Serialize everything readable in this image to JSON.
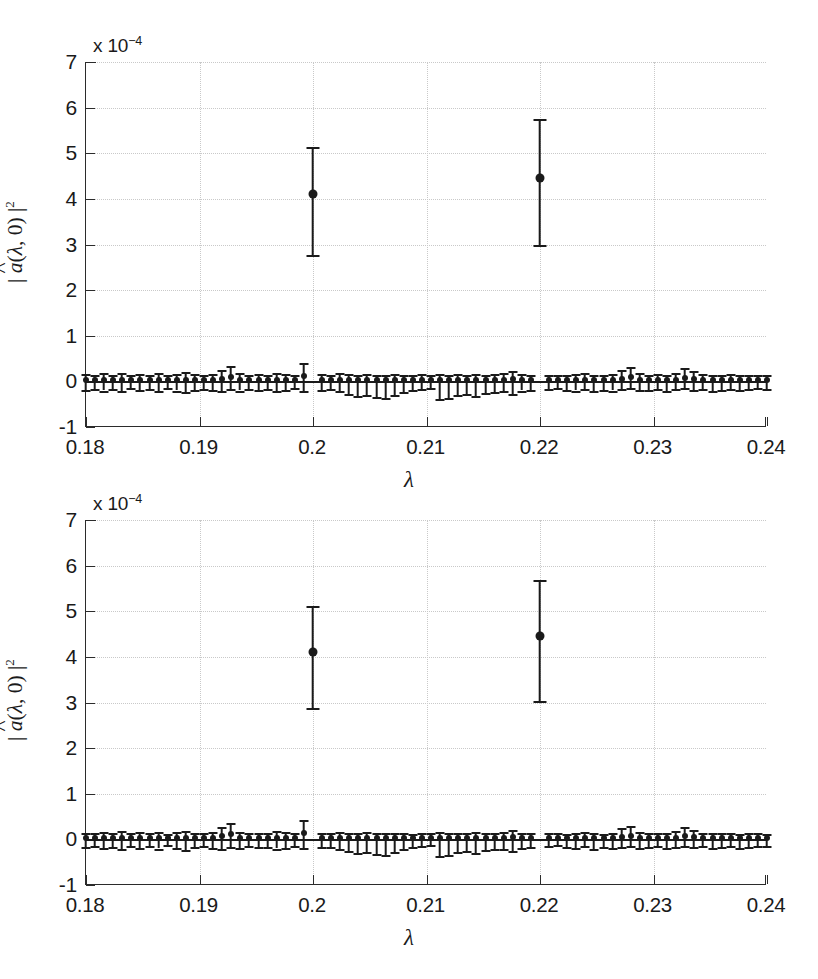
{
  "figure": {
    "panel_count": 2,
    "background": "#ffffff",
    "foreground": "#1a1a1a",
    "grid_color": "#c9c9c9"
  },
  "chart_data": [
    {
      "type": "scatter",
      "panel_index": 0,
      "title": "",
      "xlabel": "λ",
      "ylabel": "| â(λ, 0) |²",
      "y_exponent_label": "x 10",
      "y_exponent_power": "−4",
      "y_scale": 0.0001,
      "xlim": [
        0.18,
        0.24
      ],
      "ylim": [
        -1,
        7
      ],
      "xticks": [
        0.18,
        0.19,
        0.2,
        0.21,
        0.22,
        0.23,
        0.24
      ],
      "xticklabels": [
        "0.18",
        "0.19",
        "0.2",
        "0.21",
        "0.22",
        "0.23",
        "0.24"
      ],
      "yticks": [
        -1,
        0,
        1,
        2,
        3,
        4,
        5,
        6,
        7
      ],
      "yticklabels": [
        "-1",
        "0",
        "1",
        "2",
        "3",
        "4",
        "5",
        "6",
        "7"
      ],
      "grid": true,
      "legend": "none",
      "marker": "filled-circle",
      "errorbar_style": "capped-vertical",
      "series": [
        {
          "name": "peaks",
          "x": [
            0.2,
            0.22
          ],
          "y": [
            4.1,
            4.45
          ],
          "y_lower": [
            2.78,
            3.0
          ],
          "y_upper": [
            5.13,
            5.75
          ]
        },
        {
          "name": "noise-floor",
          "x": [
            0.18,
            0.1808,
            0.1816,
            0.1824,
            0.1832,
            0.184,
            0.1848,
            0.1856,
            0.1864,
            0.1872,
            0.188,
            0.1888,
            0.1896,
            0.1904,
            0.1912,
            0.192,
            0.1928,
            0.1936,
            0.1944,
            0.1952,
            0.196,
            0.1968,
            0.1976,
            0.1984,
            0.1992,
            0.2008,
            0.2016,
            0.2024,
            0.2032,
            0.204,
            0.2048,
            0.2056,
            0.2064,
            0.2072,
            0.208,
            0.2088,
            0.2096,
            0.2104,
            0.2112,
            0.212,
            0.2128,
            0.2136,
            0.2144,
            0.2152,
            0.216,
            0.2168,
            0.2176,
            0.2184,
            0.2192,
            0.2208,
            0.2216,
            0.2224,
            0.2232,
            0.224,
            0.2248,
            0.2256,
            0.2264,
            0.2272,
            0.228,
            0.2288,
            0.2296,
            0.2304,
            0.2312,
            0.232,
            0.2328,
            0.2336,
            0.2344,
            0.2352,
            0.236,
            0.2368,
            0.2376,
            0.2384,
            0.2392,
            0.24
          ],
          "y": [
            0.02,
            0.02,
            0.03,
            0.02,
            0.03,
            0.02,
            0.03,
            0.02,
            0.03,
            0.02,
            0.03,
            0.04,
            0.03,
            0.02,
            0.03,
            0.06,
            0.1,
            0.04,
            0.03,
            0.03,
            0.03,
            0.04,
            0.03,
            0.02,
            0.12,
            0.03,
            0.03,
            0.02,
            0.03,
            0.02,
            0.03,
            0.02,
            0.02,
            0.03,
            0.02,
            0.02,
            0.03,
            0.02,
            0.03,
            0.02,
            0.03,
            0.02,
            0.03,
            0.02,
            0.03,
            0.04,
            0.05,
            0.03,
            0.03,
            0.03,
            0.03,
            0.02,
            0.03,
            0.04,
            0.03,
            0.02,
            0.03,
            0.06,
            0.09,
            0.04,
            0.03,
            0.03,
            0.03,
            0.04,
            0.08,
            0.05,
            0.03,
            0.03,
            0.02,
            0.03,
            0.02,
            0.03,
            0.02,
            0.02
          ],
          "y_lower": [
            -0.18,
            -0.16,
            -0.2,
            -0.17,
            -0.22,
            -0.15,
            -0.19,
            -0.16,
            -0.21,
            -0.14,
            -0.2,
            -0.24,
            -0.18,
            -0.16,
            -0.19,
            -0.22,
            -0.17,
            -0.2,
            -0.16,
            -0.18,
            -0.17,
            -0.21,
            -0.19,
            -0.15,
            -0.2,
            -0.18,
            -0.17,
            -0.22,
            -0.28,
            -0.32,
            -0.3,
            -0.34,
            -0.36,
            -0.3,
            -0.24,
            -0.18,
            -0.16,
            -0.14,
            -0.38,
            -0.36,
            -0.3,
            -0.28,
            -0.32,
            -0.26,
            -0.24,
            -0.22,
            -0.28,
            -0.2,
            -0.18,
            -0.16,
            -0.14,
            -0.18,
            -0.2,
            -0.16,
            -0.22,
            -0.18,
            -0.2,
            -0.17,
            -0.15,
            -0.19,
            -0.18,
            -0.16,
            -0.2,
            -0.17,
            -0.15,
            -0.18,
            -0.16,
            -0.2,
            -0.18,
            -0.16,
            -0.19,
            -0.17,
            -0.15,
            -0.16
          ],
          "y_upper": [
            0.16,
            0.14,
            0.18,
            0.15,
            0.19,
            0.14,
            0.17,
            0.15,
            0.18,
            0.13,
            0.17,
            0.2,
            0.16,
            0.14,
            0.17,
            0.26,
            0.34,
            0.18,
            0.15,
            0.16,
            0.15,
            0.19,
            0.17,
            0.14,
            0.4,
            0.16,
            0.15,
            0.18,
            0.16,
            0.14,
            0.17,
            0.14,
            0.15,
            0.16,
            0.14,
            0.13,
            0.16,
            0.14,
            0.17,
            0.15,
            0.16,
            0.14,
            0.17,
            0.14,
            0.16,
            0.18,
            0.22,
            0.16,
            0.15,
            0.15,
            0.14,
            0.13,
            0.16,
            0.18,
            0.15,
            0.13,
            0.16,
            0.26,
            0.32,
            0.18,
            0.15,
            0.16,
            0.15,
            0.19,
            0.3,
            0.22,
            0.16,
            0.15,
            0.14,
            0.16,
            0.13,
            0.15,
            0.14,
            0.13
          ]
        }
      ]
    },
    {
      "type": "scatter",
      "panel_index": 1,
      "title": "",
      "xlabel": "λ",
      "ylabel": "| â(λ, 0) |²",
      "y_exponent_label": "x 10",
      "y_exponent_power": "−4",
      "y_scale": 0.0001,
      "xlim": [
        0.18,
        0.24
      ],
      "ylim": [
        -1,
        7
      ],
      "xticks": [
        0.18,
        0.19,
        0.2,
        0.21,
        0.22,
        0.23,
        0.24
      ],
      "xticklabels": [
        "0.18",
        "0.19",
        "0.2",
        "0.21",
        "0.22",
        "0.23",
        "0.24"
      ],
      "yticks": [
        -1,
        0,
        1,
        2,
        3,
        4,
        5,
        6,
        7
      ],
      "yticklabels": [
        "-1",
        "0",
        "1",
        "2",
        "3",
        "4",
        "5",
        "6",
        "7"
      ],
      "grid": true,
      "legend": "none",
      "marker": "filled-circle",
      "errorbar_style": "capped-vertical",
      "series": [
        {
          "name": "peaks",
          "x": [
            0.2,
            0.22
          ],
          "y": [
            4.1,
            4.45
          ],
          "y_lower": [
            2.87,
            3.03
          ],
          "y_upper": [
            5.12,
            5.68
          ]
        },
        {
          "name": "noise-floor",
          "x": [
            0.18,
            0.1808,
            0.1816,
            0.1824,
            0.1832,
            0.184,
            0.1848,
            0.1856,
            0.1864,
            0.1872,
            0.188,
            0.1888,
            0.1896,
            0.1904,
            0.1912,
            0.192,
            0.1928,
            0.1936,
            0.1944,
            0.1952,
            0.196,
            0.1968,
            0.1976,
            0.1984,
            0.1992,
            0.2008,
            0.2016,
            0.2024,
            0.2032,
            0.204,
            0.2048,
            0.2056,
            0.2064,
            0.2072,
            0.208,
            0.2088,
            0.2096,
            0.2104,
            0.2112,
            0.212,
            0.2128,
            0.2136,
            0.2144,
            0.2152,
            0.216,
            0.2168,
            0.2176,
            0.2184,
            0.2192,
            0.2208,
            0.2216,
            0.2224,
            0.2232,
            0.224,
            0.2248,
            0.2256,
            0.2264,
            0.2272,
            0.228,
            0.2288,
            0.2296,
            0.2304,
            0.2312,
            0.232,
            0.2328,
            0.2336,
            0.2344,
            0.2352,
            0.236,
            0.2368,
            0.2376,
            0.2384,
            0.2392,
            0.24
          ],
          "y": [
            0.02,
            0.02,
            0.03,
            0.02,
            0.03,
            0.02,
            0.03,
            0.02,
            0.03,
            0.02,
            0.03,
            0.04,
            0.03,
            0.02,
            0.03,
            0.07,
            0.11,
            0.04,
            0.03,
            0.03,
            0.03,
            0.04,
            0.03,
            0.02,
            0.14,
            0.03,
            0.03,
            0.02,
            0.03,
            0.02,
            0.03,
            0.02,
            0.02,
            0.03,
            0.02,
            0.02,
            0.03,
            0.02,
            0.03,
            0.02,
            0.03,
            0.02,
            0.03,
            0.02,
            0.03,
            0.04,
            0.05,
            0.03,
            0.03,
            0.03,
            0.03,
            0.02,
            0.03,
            0.04,
            0.03,
            0.02,
            0.03,
            0.05,
            0.08,
            0.04,
            0.03,
            0.03,
            0.03,
            0.04,
            0.07,
            0.05,
            0.03,
            0.03,
            0.02,
            0.03,
            0.02,
            0.03,
            0.02,
            0.02
          ],
          "y_lower": [
            -0.17,
            -0.15,
            -0.19,
            -0.16,
            -0.21,
            -0.14,
            -0.18,
            -0.15,
            -0.2,
            -0.13,
            -0.19,
            -0.23,
            -0.17,
            -0.15,
            -0.18,
            -0.21,
            -0.16,
            -0.19,
            -0.15,
            -0.17,
            -0.16,
            -0.2,
            -0.18,
            -0.14,
            -0.19,
            -0.17,
            -0.16,
            -0.21,
            -0.26,
            -0.3,
            -0.28,
            -0.32,
            -0.34,
            -0.28,
            -0.22,
            -0.17,
            -0.15,
            -0.13,
            -0.36,
            -0.34,
            -0.28,
            -0.26,
            -0.3,
            -0.24,
            -0.22,
            -0.21,
            -0.26,
            -0.19,
            -0.17,
            -0.15,
            -0.13,
            -0.17,
            -0.19,
            -0.15,
            -0.21,
            -0.17,
            -0.19,
            -0.16,
            -0.14,
            -0.18,
            -0.17,
            -0.15,
            -0.19,
            -0.16,
            -0.14,
            -0.17,
            -0.15,
            -0.19,
            -0.17,
            -0.15,
            -0.18,
            -0.16,
            -0.14,
            -0.15
          ],
          "y_upper": [
            0.15,
            0.13,
            0.17,
            0.14,
            0.18,
            0.13,
            0.16,
            0.14,
            0.17,
            0.12,
            0.16,
            0.19,
            0.15,
            0.13,
            0.16,
            0.28,
            0.36,
            0.17,
            0.14,
            0.15,
            0.14,
            0.18,
            0.16,
            0.13,
            0.42,
            0.15,
            0.14,
            0.17,
            0.15,
            0.13,
            0.16,
            0.13,
            0.14,
            0.15,
            0.13,
            0.12,
            0.15,
            0.13,
            0.16,
            0.14,
            0.15,
            0.13,
            0.16,
            0.13,
            0.15,
            0.17,
            0.21,
            0.15,
            0.14,
            0.14,
            0.13,
            0.12,
            0.15,
            0.17,
            0.14,
            0.12,
            0.15,
            0.24,
            0.3,
            0.17,
            0.14,
            0.15,
            0.14,
            0.18,
            0.28,
            0.2,
            0.15,
            0.14,
            0.13,
            0.15,
            0.12,
            0.14,
            0.13,
            0.12
          ]
        }
      ]
    }
  ]
}
